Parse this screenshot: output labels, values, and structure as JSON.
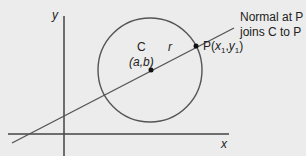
{
  "diagram": {
    "axes": {
      "x_label": "x",
      "y_label": "y"
    },
    "circle": {
      "center_label": "C",
      "center_coords": "(a,b)",
      "radius_label": "r"
    },
    "point": {
      "label_prefix": "P(",
      "x": "x",
      "x_sub": "1",
      "comma": ",",
      "y": "y",
      "y_sub": "1",
      "label_suffix": ")"
    },
    "annotation": {
      "line1": "Normal at P",
      "line2": "joins C to P"
    },
    "colors": {
      "stroke": "#555555",
      "background": "#ececec",
      "text": "#222222"
    }
  }
}
